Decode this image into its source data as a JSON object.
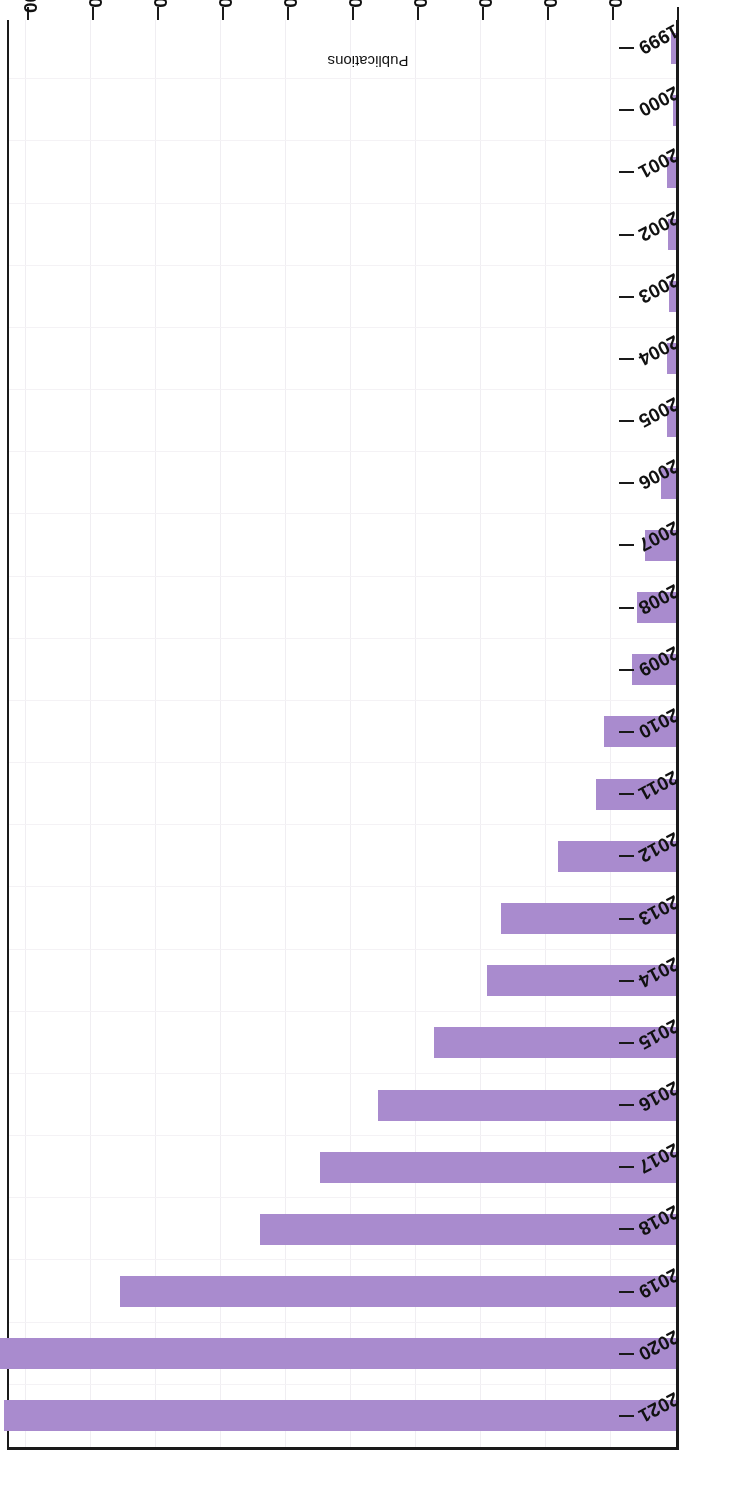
{
  "chart_data": {
    "type": "bar",
    "orientation": "horizontal",
    "title": "",
    "subtitle": "",
    "xlabel": "Publications",
    "ylabel": "",
    "xlim": [
      0,
      1034
    ],
    "xticks": [
      0,
      100,
      200,
      300,
      400,
      500,
      600,
      700,
      800,
      900,
      1000
    ],
    "xtick_labels": [
      "0",
      "100",
      "200",
      "300",
      "400",
      "500",
      "600",
      "700",
      "800",
      "900",
      "1000"
    ],
    "grid": true,
    "legend": null,
    "legend_position": "none",
    "bar_color": "#a98bce",
    "axis_color": "#1a1a1a",
    "background_color": "#ffffff",
    "rotation_note": "figure rendered upside-down (180 degrees)",
    "categories": [
      "2021",
      "2020",
      "2019",
      "2018",
      "2017",
      "2016",
      "2015",
      "2014",
      "2013",
      "2012",
      "2011",
      "2010",
      "2009",
      "2008",
      "2007",
      "2006",
      "2005",
      "2004",
      "2003",
      "2002",
      "2001",
      "2000",
      "1999"
    ],
    "values": [
      1034,
      1040,
      856,
      640,
      548,
      459,
      373,
      290,
      269,
      182,
      123,
      110,
      68,
      60,
      47,
      23,
      14,
      14,
      10,
      13,
      14,
      3,
      8
    ],
    "series": [
      {
        "name": "Publications",
        "values": [
          1034,
          1040,
          856,
          640,
          548,
          459,
          373,
          290,
          269,
          182,
          123,
          110,
          68,
          60,
          47,
          23,
          14,
          14,
          10,
          13,
          14,
          3,
          8
        ]
      }
    ]
  },
  "axes": {
    "value_axis_title": "Publications"
  }
}
